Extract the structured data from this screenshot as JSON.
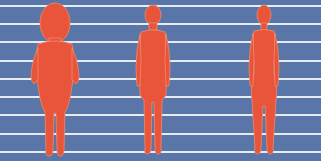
{
  "colors": {
    "panel": "#5a76a8",
    "lines": "#e6ecf5",
    "figure": "#e8553a",
    "figure_outline": "#f08a6a",
    "background": "#ffffff"
  },
  "grid_lines_y": [
    5,
    23,
    41,
    60,
    78,
    96,
    114,
    133,
    151
  ],
  "figures": [
    {
      "name": "overweight-child-silhouette"
    },
    {
      "name": "boy-silhouette"
    },
    {
      "name": "girl-silhouette"
    }
  ]
}
